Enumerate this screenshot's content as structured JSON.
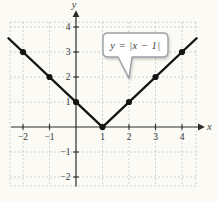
{
  "chart_data": {
    "type": "line",
    "equation_label": "y = |x − 1|",
    "function": "y = |x - 1|",
    "vertex": [
      1,
      0
    ],
    "series": [
      {
        "name": "y = |x − 1|",
        "points": [
          [
            -2,
            3
          ],
          [
            -1,
            2
          ],
          [
            0,
            1
          ],
          [
            1,
            0
          ],
          [
            2,
            1
          ],
          [
            3,
            2
          ],
          [
            4,
            3
          ]
        ]
      }
    ],
    "line_extent": {
      "x_start": -2.55,
      "x_end": 4.55
    },
    "x_ticks": {
      "values": [
        -2,
        -1,
        1,
        2,
        3,
        4
      ],
      "labels": [
        "−2",
        "−1",
        "1",
        "2",
        "3",
        "4"
      ]
    },
    "y_ticks": {
      "values": [
        -2,
        -1,
        1,
        2,
        3,
        4
      ],
      "labels": [
        "−2",
        "−1",
        "1",
        "2",
        "3",
        "4"
      ]
    },
    "xlabel": "x",
    "ylabel": "y",
    "xlim": [
      -2.5,
      4.5
    ],
    "ylim": [
      -2.5,
      4.5
    ],
    "grid": true,
    "legend": "callout pointing to line",
    "colors": {
      "curve": "#141414",
      "point": "#141414",
      "grid": "#bdc9d3",
      "axis": "#2b2b2b",
      "tick_label": "#333333",
      "callout_border": "#9aa0a6",
      "callout_fill": "#ffffff",
      "background": "#fbfaf5"
    }
  }
}
